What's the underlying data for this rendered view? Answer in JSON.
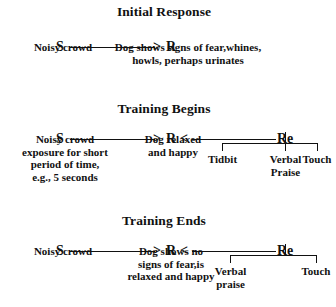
{
  "figure": {
    "panels": [
      {
        "title": "Initial Response",
        "stimulus_label": "S",
        "response_label": "R",
        "reinforcer_label": "",
        "stimulus_caption": "Noisy crowd",
        "response_caption_line1": "Dog shows signs of fear,whines,",
        "response_caption_line2": "howls, perhaps urinates",
        "reinforcers": []
      },
      {
        "title": "Training Begins",
        "stimulus_label": "S",
        "response_label": "R",
        "reinforcer_label": "Re",
        "stimulus_caption_line1": "Noisy crowd",
        "stimulus_caption_line2": "exposure for short",
        "stimulus_caption_line3": "period of time,",
        "stimulus_caption_line4": "e.g., 5 seconds",
        "response_caption_line1": "Dog relaxed",
        "response_caption_line2": "and happy",
        "reinforcers": [
          {
            "line1": "Tidbit",
            "line2": ""
          },
          {
            "line1": "Verbal",
            "line2": "Praise"
          },
          {
            "line1": "Touch",
            "line2": ""
          }
        ]
      },
      {
        "title": "Training Ends",
        "stimulus_label": "S",
        "response_label": "R",
        "reinforcer_label": "Re",
        "stimulus_caption": "Noisy crowd",
        "response_caption_line1": "Dog shows no",
        "response_caption_line2": "signs of fear,is",
        "response_caption_line3": "relaxed and happy",
        "reinforcers": [
          {
            "line1": "Verbal",
            "line2": "praise"
          },
          {
            "line1": "Touch",
            "line2": ""
          }
        ]
      }
    ],
    "glyphs": {
      "arrow_right": ">",
      "arrow_left": "<"
    },
    "colors": {
      "ink": "#111111",
      "background": "#ffffff"
    }
  }
}
